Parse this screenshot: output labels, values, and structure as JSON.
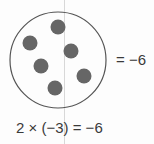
{
  "diagram": {
    "set_circle": {
      "cx": 58,
      "cy": 60,
      "r": 48,
      "stroke": "#555555"
    },
    "counters": [
      {
        "cx": 58,
        "cy": 27
      },
      {
        "cx": 30,
        "cy": 43
      },
      {
        "cx": 71,
        "cy": 51
      },
      {
        "cx": 41,
        "cy": 66
      },
      {
        "cx": 84,
        "cy": 76
      },
      {
        "cx": 55,
        "cy": 88
      }
    ],
    "counter_color": "#666666",
    "counter_radius": 7.5,
    "counter_count": 6,
    "right_label": "= −6",
    "equation": "2 × (−3) = −6"
  }
}
